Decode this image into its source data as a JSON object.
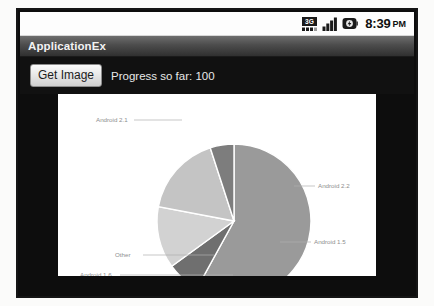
{
  "status_bar": {
    "icons": [
      "3g-data-icon",
      "signal-bars-icon",
      "battery-icon"
    ],
    "data_label": "3G",
    "time": "8:39",
    "ampm": "PM"
  },
  "title_bar": {
    "app_title": "ApplicationEx"
  },
  "controls": {
    "get_image_label": "Get Image",
    "progress_text": "Progress so far: 100"
  },
  "colors": {
    "title_bar_dark": "#303030",
    "app_background": "#111111",
    "chart_background": "#ffffff",
    "label_color": "#8e8e8e",
    "leader_color": "#b0b0b0"
  },
  "chart_data": {
    "type": "pie",
    "title": "",
    "legend_position": "callout-labels",
    "grid": false,
    "labels": [
      "Android 2.1",
      "Android 2.2",
      "Android 1.5",
      "Android 1.6",
      "Other"
    ],
    "values": [
      58,
      7,
      13,
      17,
      5
    ],
    "slice_colors": [
      "#9a9a9a",
      "#6f6f6f",
      "#d2d2d2",
      "#c4c4c4",
      "#7d7d7d"
    ],
    "slices": [
      {
        "label": "Android 2.1",
        "value": 58,
        "color": "#9a9a9a",
        "start_angle": -90,
        "end_angle": 118.8
      },
      {
        "label": "Android 2.2",
        "value": 7,
        "color": "#6f6f6f",
        "start_angle": -90,
        "end_angle": -64.8
      },
      {
        "label": "Android 1.5",
        "value": 13,
        "color": "#d2d2d2",
        "start_angle": -64.8,
        "end_angle": -18.0
      },
      {
        "label": "Android 1.6",
        "value": 17,
        "color": "#c4c4c4",
        "start_angle": -18.0,
        "end_angle": 43.2
      },
      {
        "label": "Other",
        "value": 5,
        "color": "#7d7d7d",
        "start_angle": 43.2,
        "end_angle": 61.2
      }
    ],
    "label_positions": [
      {
        "label": "Android 2.1",
        "text_x": 38,
        "text_y": 28,
        "anchor": "start",
        "line": [
          [
            76,
            26
          ],
          [
            124,
            26
          ]
        ]
      },
      {
        "label": "Android 2.2",
        "text_x": 260,
        "text_y": 94,
        "anchor": "start",
        "line": [
          [
            236,
            92
          ],
          [
            257,
            92
          ]
        ]
      },
      {
        "label": "Android 1.5",
        "text_x": 256,
        "text_y": 150,
        "anchor": "start",
        "line": [
          [
            222,
            148
          ],
          [
            253,
            148
          ]
        ]
      },
      {
        "label": "Android 1.6",
        "text_x": 22,
        "text_y": 183,
        "anchor": "start",
        "line": [
          [
            62,
            181
          ],
          [
            175,
            181
          ]
        ]
      },
      {
        "label": "Other",
        "text_x": 57,
        "text_y": 163,
        "anchor": "start",
        "line": [
          [
            85,
            161
          ],
          [
            156,
            161
          ]
        ]
      }
    ],
    "center": {
      "cx": 176,
      "cy": 127
    },
    "radius": 77
  }
}
